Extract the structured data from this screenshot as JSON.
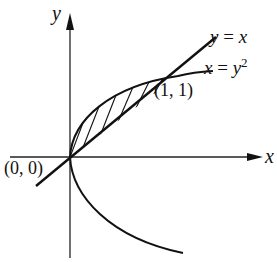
{
  "figure": {
    "axes": {
      "x_label": "x",
      "y_label": "y"
    },
    "curves": [
      {
        "name": "line",
        "label_lhs": "y",
        "label_op": "=",
        "label_rhs": "x",
        "equation": "y = x"
      },
      {
        "name": "parabola",
        "label_lhs": "x",
        "label_op": "=",
        "label_rhs": "y",
        "label_exp": "2",
        "equation": "x = y^2"
      }
    ],
    "points": [
      {
        "label": "(0, 0)",
        "x": 0,
        "y": 0
      },
      {
        "label": "(1, 1)",
        "x": 1,
        "y": 1
      }
    ],
    "shaded_region": {
      "between": [
        "y = x",
        "x = y^2"
      ],
      "from": "(0, 0)",
      "to": "(1, 1)",
      "fill": "hatched"
    },
    "colors": {
      "ink": "#111111",
      "background": "#ffffff"
    }
  }
}
